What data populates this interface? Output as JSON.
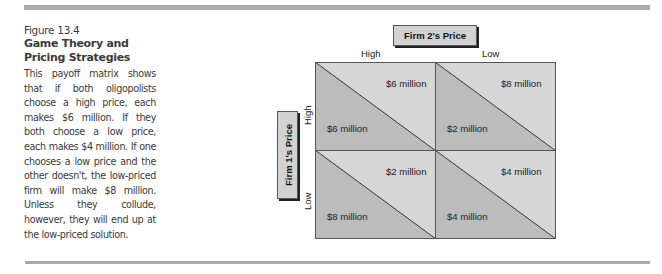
{
  "caption": {
    "figure_number": "Figure 13.4",
    "title": "Game Theory and Pricing Strategies",
    "body": "This payoff matrix shows that if both oligopolists choose a high price, each makes $6 million. If they both choose a low price, each makes $4 million. If one chooses a low price and the other doesn't, the low-priced firm will make $8 million. Unless they collude, however, they will end up at the low-priced solution."
  },
  "matrix": {
    "column_player": "Firm 2's Price",
    "row_player": "Firm 1's Price",
    "columns": [
      "High",
      "Low"
    ],
    "rows": [
      "High",
      "Low"
    ],
    "cells": [
      {
        "row": "High",
        "col": "High",
        "firm2": "$6 million",
        "firm1": "$6 million"
      },
      {
        "row": "High",
        "col": "Low",
        "firm2": "$8 million",
        "firm1": "$2 million"
      },
      {
        "row": "Low",
        "col": "High",
        "firm2": "$2 million",
        "firm1": "$8 million"
      },
      {
        "row": "Low",
        "col": "Low",
        "firm2": "$4 million",
        "firm1": "$4 million"
      }
    ]
  },
  "colors": {
    "upper_triangle": "#d6d6d6",
    "lower_triangle": "#bcbcbc",
    "grid_line": "#555555",
    "rule": "#a9a9a9"
  }
}
